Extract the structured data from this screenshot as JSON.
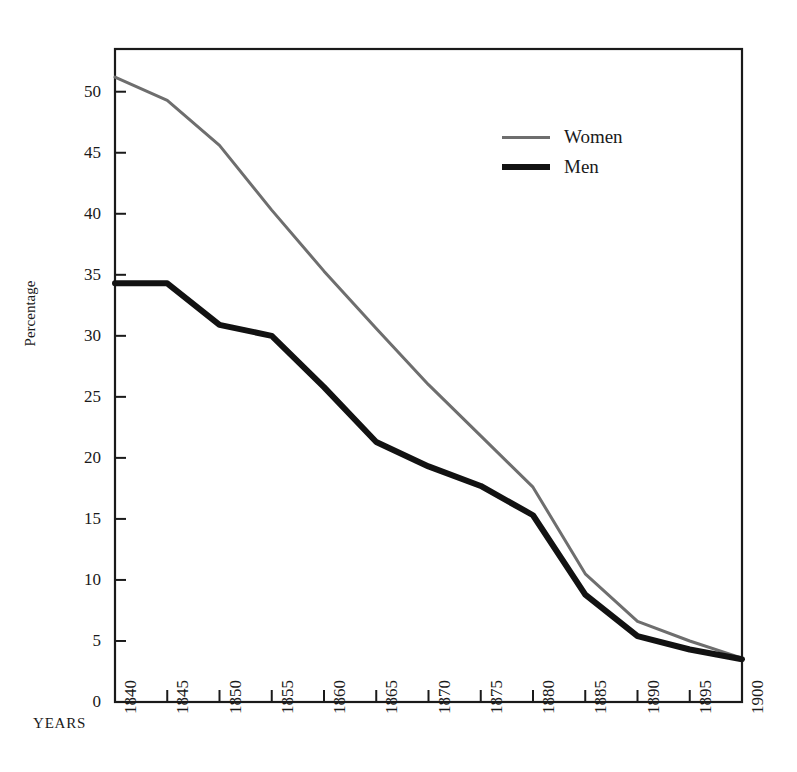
{
  "figure": {
    "title_faint": "",
    "years_axis_label": "YEARS"
  },
  "legend": {
    "position": "inside-top-right",
    "entries": [
      {
        "label": "Women",
        "color": "#6e6e6e",
        "width": 3
      },
      {
        "label": "Men",
        "color": "#121212",
        "width": 6
      }
    ]
  },
  "chart_data": {
    "type": "line",
    "title": "",
    "xlabel": "YEARS",
    "ylabel": "Percentage",
    "x": [
      1840,
      1845,
      1850,
      1855,
      1860,
      1865,
      1870,
      1875,
      1880,
      1885,
      1890,
      1895,
      1900
    ],
    "xtick_labels": [
      "1840",
      "1845",
      "1850",
      "1855",
      "1860",
      "1865",
      "1870",
      "1875",
      "1880",
      "1885",
      "1890",
      "1895",
      "1900"
    ],
    "ytick_labels": [
      "0",
      "5",
      "10",
      "15",
      "20",
      "25",
      "30",
      "35",
      "40",
      "45",
      "50"
    ],
    "ytick_values": [
      0,
      5,
      10,
      15,
      20,
      25,
      30,
      35,
      40,
      45,
      50
    ],
    "ylim": [
      0,
      53.5
    ],
    "xlim": [
      1840,
      1900
    ],
    "grid": false,
    "series": [
      {
        "name": "Women",
        "color": "#6e6e6e",
        "linewidth": 3,
        "values": [
          51.2,
          49.3,
          45.6,
          40.3,
          35.3,
          30.6,
          26.0,
          21.8,
          17.6,
          10.5,
          6.6,
          5.0,
          3.6
        ]
      },
      {
        "name": "Men",
        "color": "#121212",
        "linewidth": 6,
        "values": [
          34.3,
          34.3,
          30.9,
          30.0,
          25.8,
          21.3,
          19.3,
          17.7,
          15.3,
          8.8,
          5.4,
          4.3,
          3.5
        ]
      }
    ]
  }
}
